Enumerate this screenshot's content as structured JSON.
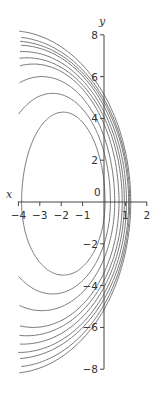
{
  "chart_data": {
    "type": "line",
    "title": "",
    "xlabel": "x",
    "ylabel": "y",
    "xlim": [
      -4,
      2
    ],
    "ylim": [
      -8,
      8
    ],
    "x_ticks": [
      -4,
      -3,
      -2,
      -1,
      0,
      1,
      2
    ],
    "x_tick_labels": [
      "−4",
      "−3",
      "−2",
      "−1",
      "",
      "1",
      "2"
    ],
    "y_ticks": [
      -8,
      -6,
      -4,
      -2,
      2,
      4,
      6,
      8
    ],
    "y_tick_labels": [
      "−8",
      "−6",
      "−4",
      "−2",
      "2",
      "4",
      "6",
      "8"
    ],
    "origin_label": "0",
    "grid": false,
    "legend": null,
    "line_color": "#7a7a7a",
    "text_color": "#333333",
    "series": [
      {
        "name": "curve-1",
        "vertex_x": 1.25,
        "y_top_at_x_-4": 7.0,
        "y_bottom_at_x_-4": -7.0
      },
      {
        "name": "curve-2",
        "vertex_x": 1.2,
        "y_top_at_x_-4": 6.7,
        "y_bottom_at_x_-4": -6.7
      },
      {
        "name": "curve-3",
        "vertex_x": 1.15,
        "y_top_at_x_-4": 6.5,
        "y_bottom_at_x_-4": -6.3
      },
      {
        "name": "curve-4",
        "vertex_x": 1.05,
        "y_top_at_x_-4": 6.3,
        "y_bottom_at_x_-4": -6.0
      },
      {
        "name": "curve-5",
        "vertex_x": 0.95,
        "y_top_at_x_-4": 6.0,
        "y_bottom_at_x_-4": -5.6
      },
      {
        "name": "curve-6",
        "vertex_x": 0.85,
        "y_top_at_x_-4": 5.7,
        "y_bottom_at_x_-4": -5.2
      },
      {
        "name": "curve-7",
        "vertex_x": 0.7,
        "y_top_at_x_-4": 5.4,
        "y_bottom_at_x_-4": -4.8
      },
      {
        "name": "curve-8",
        "vertex_x": 0.5,
        "y_top_at_x_-4": 5.0,
        "y_bottom_at_x_-4": -4.0
      },
      {
        "name": "curve-9",
        "vertex_x": 0.3,
        "y_top_at_x_-4": 4.5,
        "y_bottom_at_x_-4": -3.3
      },
      {
        "name": "curve-10",
        "vertex_x": 0.05,
        "y_top_at_x_-4": 3.9,
        "y_bottom_at_x_-4": -2.4
      }
    ],
    "curve_params": [
      {
        "cx": -4.4,
        "top": {
          "ry": 8.2
        },
        "bot": {
          "ry": 8.2
        }
      },
      {
        "cx": -4.3,
        "top": {
          "ry": 7.9
        },
        "bot": {
          "ry": 7.9
        }
      },
      {
        "cx": -4.2,
        "top": {
          "ry": 7.7
        },
        "bot": {
          "ry": 7.5
        }
      },
      {
        "cx": -4.0,
        "top": {
          "ry": 7.5
        },
        "bot": {
          "ry": 7.2
        }
      },
      {
        "cx": -3.8,
        "top": {
          "ry": 7.2
        },
        "bot": {
          "ry": 6.8
        }
      },
      {
        "cx": -3.6,
        "top": {
          "ry": 6.9
        },
        "bot": {
          "ry": 6.4
        }
      },
      {
        "cx": -3.3,
        "top": {
          "ry": 6.6
        },
        "bot": {
          "ry": 6.0
        }
      },
      {
        "cx": -2.9,
        "top": {
          "ry": 6.0
        },
        "bot": {
          "ry": 5.2
        }
      },
      {
        "cx": -2.4,
        "top": {
          "ry": 5.2
        },
        "bot": {
          "ry": 4.4
        }
      },
      {
        "cx": -1.9,
        "top": {
          "ry": 4.3
        },
        "bot": {
          "ry": 3.5
        }
      }
    ]
  }
}
